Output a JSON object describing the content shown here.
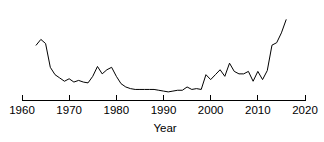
{
  "chart_data": {
    "type": "line",
    "title": "",
    "xlabel": "Year",
    "ylabel": "",
    "xlim": [
      1960,
      2020
    ],
    "ylim": [
      0,
      1
    ],
    "grid": false,
    "legend": null,
    "line_color": "#000000",
    "axis_color": "#000000",
    "background": "#ffffff",
    "x_ticks": [
      1960,
      1970,
      1980,
      1990,
      2000,
      2010,
      2020
    ],
    "x_tick_labels": [
      "1960",
      "1970",
      "1980",
      "1990",
      "2000",
      "2010",
      "2020"
    ],
    "y_axis_visible": false,
    "series": [
      {
        "name": "count",
        "x": [
          1963,
          1964,
          1965,
          1966,
          1967,
          1968,
          1969,
          1970,
          1971,
          1972,
          1973,
          1974,
          1975,
          1976,
          1977,
          1978,
          1979,
          1980,
          1981,
          1982,
          1983,
          1984,
          1985,
          1986,
          1987,
          1988,
          1989,
          1990,
          1991,
          1992,
          1993,
          1994,
          1995,
          1996,
          1997,
          1998,
          1999,
          2000,
          2001,
          2002,
          2003,
          2004,
          2005,
          2006,
          2007,
          2008,
          2009,
          2010,
          2011,
          2012,
          2013,
          2014,
          2015,
          2016
        ],
        "values": [
          0.62,
          0.69,
          0.64,
          0.35,
          0.26,
          0.22,
          0.18,
          0.21,
          0.17,
          0.19,
          0.17,
          0.16,
          0.24,
          0.36,
          0.27,
          0.32,
          0.35,
          0.24,
          0.15,
          0.11,
          0.09,
          0.08,
          0.08,
          0.08,
          0.08,
          0.08,
          0.07,
          0.06,
          0.05,
          0.06,
          0.07,
          0.07,
          0.11,
          0.08,
          0.09,
          0.08,
          0.26,
          0.2,
          0.26,
          0.32,
          0.24,
          0.4,
          0.3,
          0.27,
          0.27,
          0.3,
          0.18,
          0.3,
          0.2,
          0.31,
          0.62,
          0.65,
          0.77,
          0.93
        ]
      }
    ]
  },
  "axis": {
    "x_title": "Year"
  }
}
